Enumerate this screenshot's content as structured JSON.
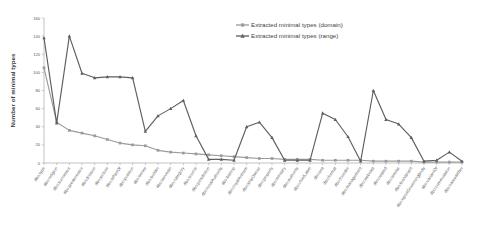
{
  "chart_data": {
    "type": "line",
    "title": "",
    "xlabel": "",
    "ylabel": "Number of minimal types",
    "ylim": [
      0,
      160
    ],
    "yticks": [
      0,
      20,
      40,
      60,
      80,
      100,
      120,
      140,
      160
    ],
    "grid": false,
    "legend_position": "top-right",
    "categories": [
      "dbo:type",
      "dbo:religion",
      "dbo:successor",
      "dbo:predecessor",
      "dbo:division",
      "dbo:picture",
      "dbo:isPartOf",
      "dbo:position",
      "dbo:series",
      "dbo:builder",
      "dbo:servesIn",
      "dbo:category",
      "dbo:source",
      "dbo:jurisdiction",
      "dbo:localAuthority",
      "dbo:bishop",
      "dbo:royalAnthem",
      "dbo:shipOwner",
      "dbo:property",
      "dbo:ministry",
      "dbo:authority",
      "dbo:chiefLabel",
      "dbo:era",
      "dbo:format",
      "dbo:founder",
      "dbo:management",
      "dbo:webcast",
      "dbo:related",
      "dbo:similar",
      "dbo:busVariant",
      "dbo:sportGoverningBody",
      "dbo:variantOf",
      "dbo:commutation",
      "dbo:namedAfter"
    ],
    "series": [
      {
        "name": "Extracted minimal types (domain)",
        "color": "#9b9b9b",
        "marker": "square",
        "values": [
          105,
          45,
          36,
          33,
          30,
          26,
          22,
          20,
          19,
          14,
          12,
          11,
          10,
          9,
          8,
          7,
          6,
          5,
          5,
          4,
          4,
          4,
          3,
          3,
          3,
          3,
          2,
          2,
          2,
          2,
          1,
          1,
          1,
          1
        ]
      },
      {
        "name": "Extracted minimal types (range)",
        "color": "#5e5e5e",
        "marker": "triangle",
        "values": [
          138,
          44,
          140,
          99,
          94,
          95,
          95,
          94,
          35,
          52,
          60,
          69,
          30,
          4,
          4,
          3,
          40,
          45,
          28,
          3,
          3,
          3,
          55,
          48,
          29,
          2,
          80,
          48,
          43,
          28,
          2,
          3,
          12,
          2
        ]
      }
    ]
  },
  "axis": {
    "y_axis_title": "Number of minimal types"
  }
}
